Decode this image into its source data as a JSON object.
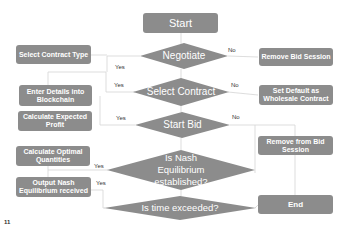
{
  "flowchart": {
    "start": "Start",
    "end": "End",
    "decisions": {
      "negotiate": "Negotiate",
      "select_contract": "Select Contract",
      "start_bid": "Start Bid",
      "nash": "Is Nash Equilibrium established?",
      "time": "Is time exceeded?"
    },
    "left_actions": {
      "select_contract_type": "Select Contract Type",
      "enter_details": "Enter Details into Blockchain",
      "calc_profit": "Calculate Expected Profit",
      "calc_quantities": "Calculate Optimal Quantities",
      "output_nash": "Output Nash Equilibrium received"
    },
    "right_actions": {
      "remove_bid_session": "Remove Bid Session",
      "set_default": "Set Default  as Wholesale Contract",
      "remove_from_bid": "Remove from Bid Session"
    },
    "labels": {
      "yes": "Yes",
      "no": "No"
    },
    "colors": {
      "node_fill": "#8c8c8c",
      "line": "#d0d0d0",
      "text": "#ffffff"
    }
  },
  "footer_mark": "11"
}
